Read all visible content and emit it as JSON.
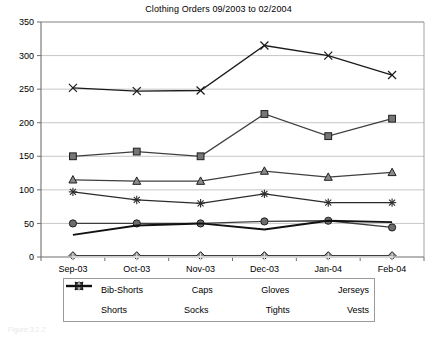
{
  "chart_data": {
    "type": "line",
    "title": "Clothing Orders 09/2003 to 02/2004",
    "xlabel": "",
    "ylabel": "",
    "ylim": [
      0,
      350
    ],
    "ytick_step": 50,
    "yticks": [
      "0",
      "50",
      "100",
      "150",
      "200",
      "250",
      "300",
      "350"
    ],
    "grid": true,
    "grid_axis": "y",
    "legend_position": "bottom",
    "categories": [
      "Sep-03",
      "Oct-03",
      "Nov-03",
      "Dec-03",
      "Jan-04",
      "Feb-04"
    ],
    "series": [
      {
        "name": "Bib-Shorts",
        "marker": "diamond",
        "color": "#3f3f3f",
        "values": [
          2,
          2,
          2,
          2,
          2,
          2
        ]
      },
      {
        "name": "Caps",
        "marker": "square",
        "color": "#3f3f3f",
        "values": [
          150,
          157,
          150,
          213,
          180,
          206
        ]
      },
      {
        "name": "Gloves",
        "marker": "triangle",
        "color": "#3f3f3f",
        "values": [
          115,
          113,
          113,
          128,
          119,
          126
        ]
      },
      {
        "name": "Jerseys",
        "marker": "x",
        "color": "#1a1a1a",
        "values": [
          252,
          247,
          248,
          315,
          300,
          271
        ]
      },
      {
        "name": "Shorts",
        "marker": "star",
        "color": "#2b2b2b",
        "values": [
          97,
          85,
          80,
          94,
          81,
          81
        ]
      },
      {
        "name": "Socks",
        "marker": "circle",
        "color": "#3f3f3f",
        "values": [
          50,
          50,
          50,
          53,
          54,
          44
        ]
      },
      {
        "name": "Tights",
        "marker": "plus",
        "color": "#e2e2e2",
        "values": [
          0,
          0,
          0,
          0,
          0,
          0
        ]
      },
      {
        "name": "Vests",
        "marker": "none",
        "color": "#111111",
        "values": [
          33,
          47,
          50,
          41,
          54,
          52
        ]
      }
    ]
  },
  "legend": {
    "row1": [
      {
        "label": "Bib-Shorts",
        "icon": "diamond-marker-icon"
      },
      {
        "label": "Caps",
        "icon": "square-marker-icon"
      },
      {
        "label": "Gloves",
        "icon": "triangle-marker-icon"
      },
      {
        "label": "Jerseys",
        "icon": "x-marker-icon"
      }
    ],
    "row2": [
      {
        "label": "Shorts",
        "icon": "star-marker-icon"
      },
      {
        "label": "Socks",
        "icon": "circle-marker-icon"
      },
      {
        "label": "Tights",
        "icon": "plus-marker-icon"
      },
      {
        "label": "Vests",
        "icon": "line-marker-icon"
      }
    ]
  },
  "caption": "Figure 3.2.2"
}
